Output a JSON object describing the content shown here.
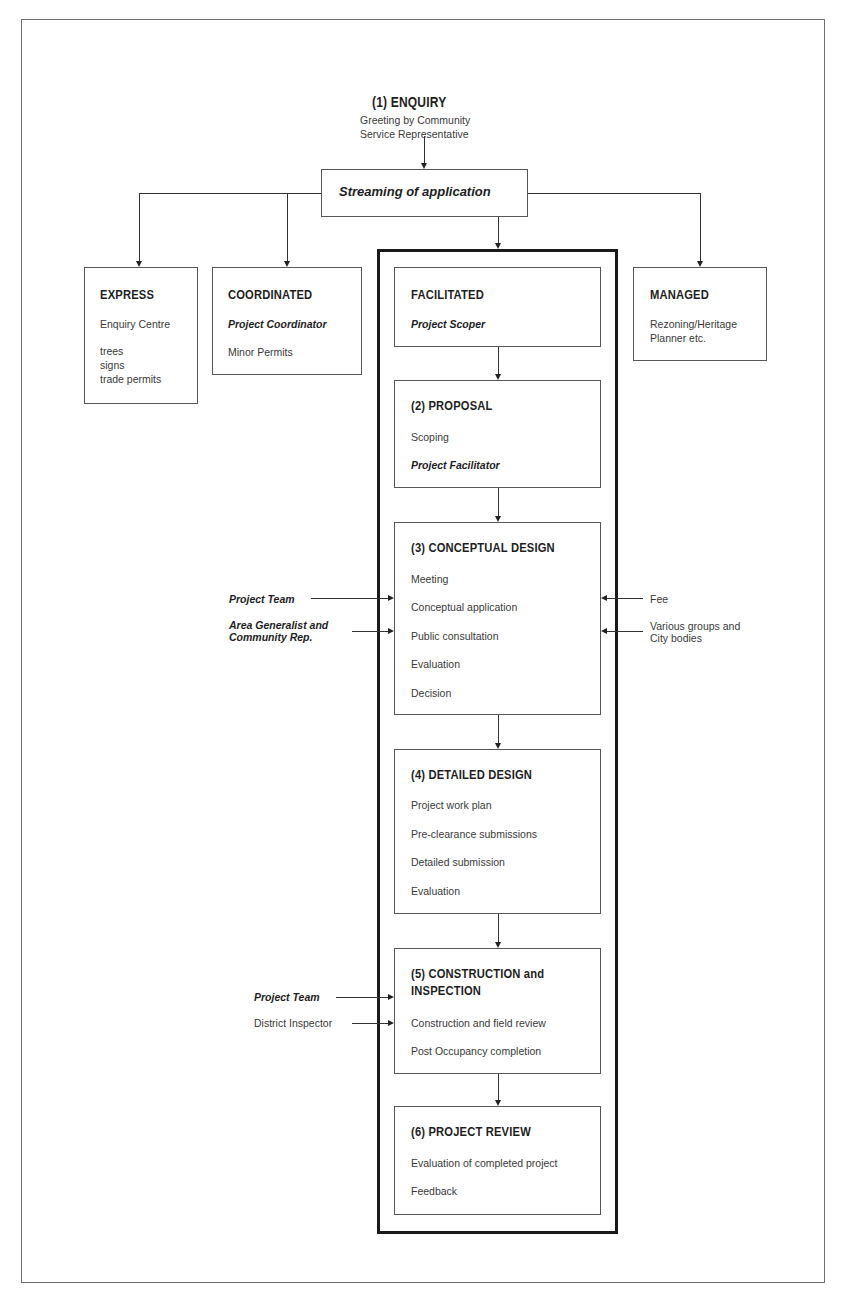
{
  "enquiry": {
    "title": "(1)  ENQUIRY",
    "line1": "Greeting by Community",
    "line2": "Service Representative"
  },
  "streaming": {
    "label": "Streaming of application"
  },
  "express": {
    "title": "EXPRESS",
    "line1": "Enquiry Centre",
    "items": [
      "trees",
      "signs",
      "trade permits"
    ]
  },
  "coordinated": {
    "title": "COORDINATED",
    "role": "Project Coordinator",
    "line1": "Minor Permits"
  },
  "facilitated": {
    "title": "FACILITATED",
    "role": "Project Scoper"
  },
  "managed": {
    "title": "MANAGED",
    "line1": "Rezoning/Heritage",
    "line2": "Planner etc."
  },
  "proposal": {
    "title": "(2) PROPOSAL",
    "line1": "Scoping",
    "role": "Project Facilitator"
  },
  "conceptual": {
    "title": "(3) CONCEPTUAL DESIGN",
    "items": [
      "Meeting",
      "Conceptual application",
      "Public consultation",
      "Evaluation",
      "Decision"
    ]
  },
  "detailed": {
    "title": "(4) DETAILED DESIGN",
    "items": [
      "Project work plan",
      "Pre-clearance submissions",
      "Detailed submission",
      "Evaluation"
    ]
  },
  "construction": {
    "title_line1": "(5) CONSTRUCTION and",
    "title_line2": "INSPECTION",
    "items": [
      "Construction and field review",
      "Post Occupancy completion"
    ]
  },
  "review": {
    "title": "(6) PROJECT REVIEW",
    "items": [
      "Evaluation of completed project",
      "Feedback"
    ]
  },
  "inputs": {
    "conceptual_left": [
      "Project Team",
      "Area Generalist and",
      "Community Rep."
    ],
    "conceptual_right": [
      "Fee",
      "Various groups and",
      "City bodies"
    ],
    "construction_left": [
      "Project Team",
      "District Inspector"
    ]
  }
}
